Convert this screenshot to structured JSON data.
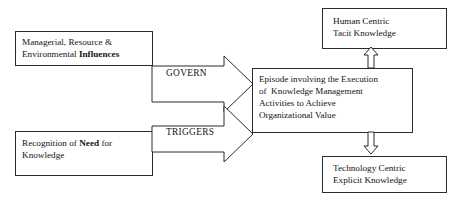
{
  "diagram": {
    "colors": {
      "stroke": "#2b2b2b",
      "fill": "#ffffff",
      "text": "#141414"
    },
    "boxes": {
      "influences": {
        "name": "Managerial, Resource & Environmental Influences",
        "line1": "Managerial, Resource &",
        "line2_plain": "Environmental ",
        "line2_bold": "Influences"
      },
      "need": {
        "name": "Recognition of Need for Knowledge",
        "line1_plain_a": "Recognition of ",
        "line1_bold": "Need",
        "line1_plain_b": " for",
        "line2": "Knowledge"
      },
      "episode": {
        "name": "Episode involving the Execution of Knowledge Management Activities to Achieve Organizational Value",
        "line1": "Episode involving the Execution",
        "line2": "of  Knowledge Management",
        "line3": "Activities to Achieve",
        "line4": "Organizational Value"
      },
      "human": {
        "name": "Human Centric Tacit Knowledge",
        "line1": "Human Centric",
        "line2": "Tacit Knowledge"
      },
      "technology": {
        "name": "Technology Centric Explicit Knowledge",
        "line1": "Technology Centric",
        "line2": "Explicit Knowledge"
      }
    },
    "arrows": {
      "govern": {
        "label": "GOVERN",
        "direction": "right",
        "from": "influences",
        "to": "episode"
      },
      "triggers": {
        "label": "TRIGGERS",
        "direction": "right",
        "from": "need",
        "to": "episode"
      },
      "up": {
        "label": "",
        "direction": "up",
        "from": "episode",
        "to": "human"
      },
      "down": {
        "label": "",
        "direction": "down",
        "from": "episode",
        "to": "technology"
      }
    }
  }
}
